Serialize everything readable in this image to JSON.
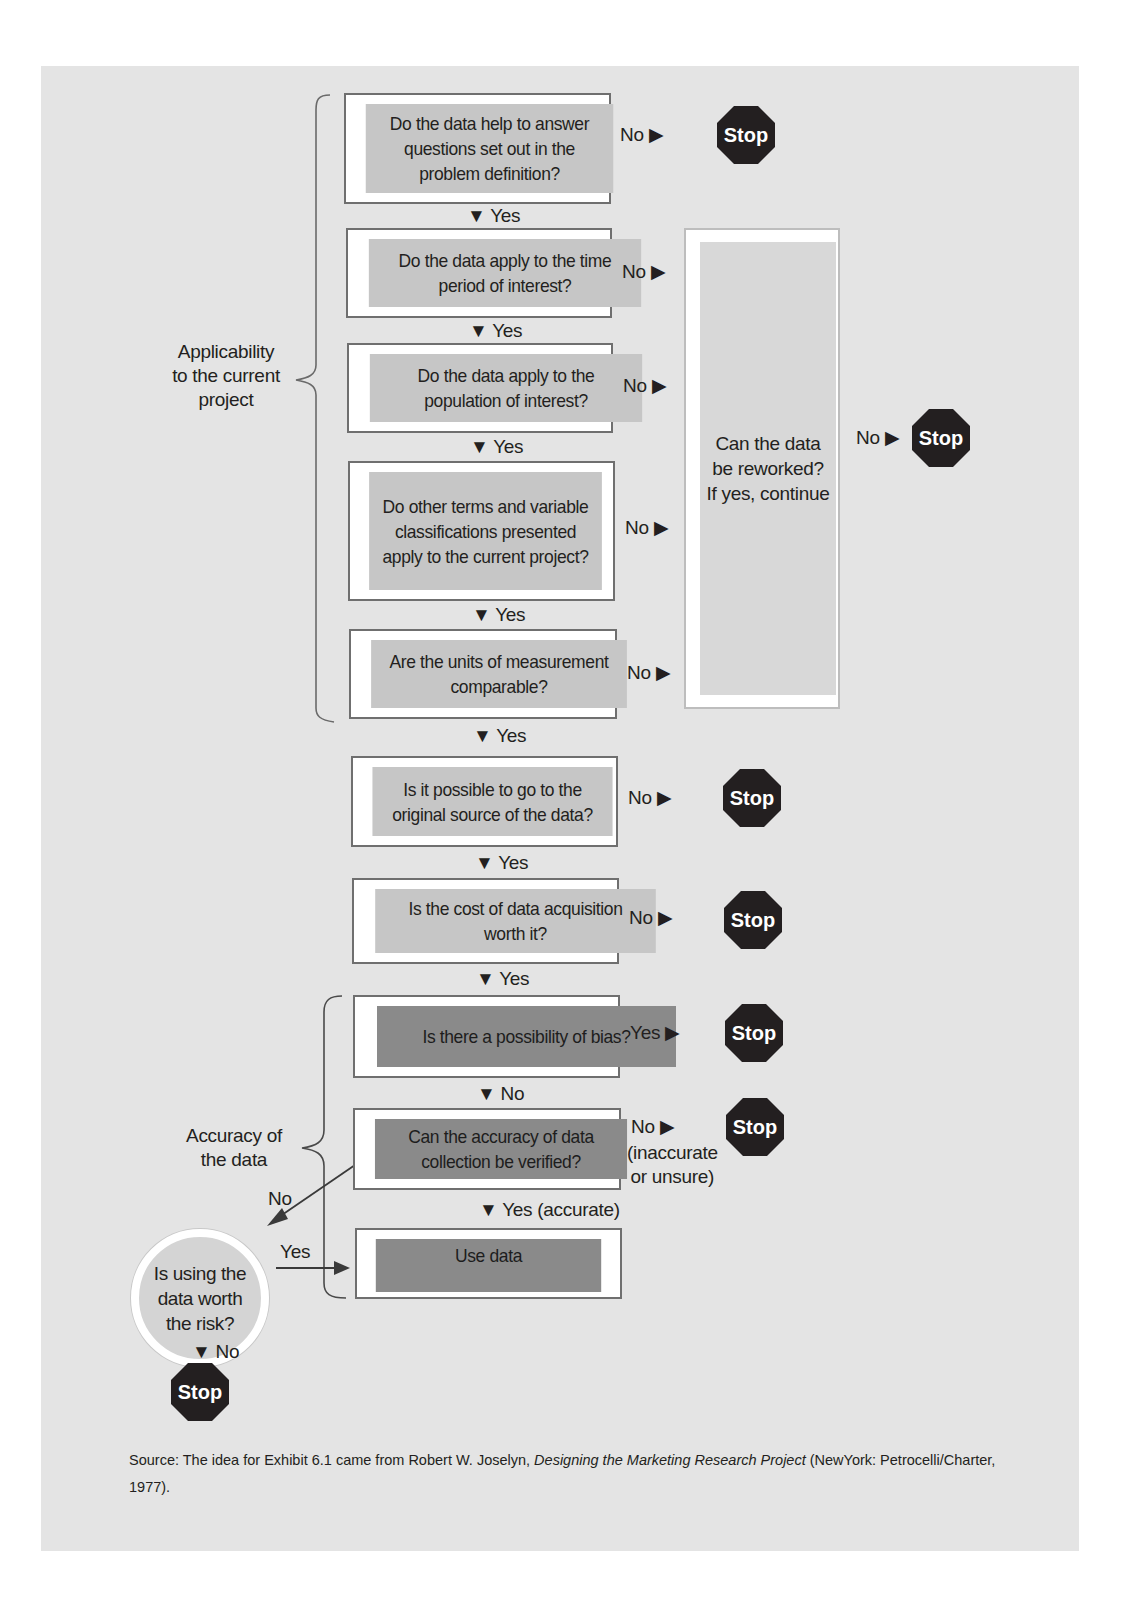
{
  "diagram": {
    "type": "flowchart",
    "groups": {
      "applicability": "Applicability\nto the current\nproject",
      "accuracy": "Accuracy of\nthe data"
    },
    "questions": [
      {
        "id": "q1",
        "text": "Do the data help to answer questions set out in the problem definition?",
        "no": "No ▶",
        "yes": "▼ Yes",
        "no_target": "Stop"
      },
      {
        "id": "q2",
        "text": "Do the data apply to the time period of interest?",
        "no": "No ▶",
        "yes": "▼ Yes",
        "no_target": "rework"
      },
      {
        "id": "q3",
        "text": "Do the data apply to the population of interest?",
        "no": "No ▶",
        "yes": "▼ Yes",
        "no_target": "rework"
      },
      {
        "id": "q4",
        "text": "Do other terms and variable classifications presented apply to the current project?",
        "no": "No ▶",
        "yes": "▼ Yes",
        "no_target": "rework"
      },
      {
        "id": "q5",
        "text": "Are the units of measurement comparable?",
        "no": "No ▶",
        "yes": "▼ Yes",
        "no_target": "rework"
      },
      {
        "id": "q6",
        "text": "Is it possible to go to the original source of the data?",
        "no": "No ▶",
        "yes": "▼ Yes",
        "no_target": "Stop"
      },
      {
        "id": "q7",
        "text": "Is the cost of data acquisition worth it?",
        "no": "No ▶",
        "yes": "▼ Yes",
        "no_target": "Stop"
      },
      {
        "id": "q8",
        "text": "Is there a possibility of bias?",
        "no": "Yes ▶",
        "yes": "▼ No",
        "no_target": "Stop"
      },
      {
        "id": "q9",
        "text": "Can the accuracy of data collection be verified?",
        "no": "No ▶",
        "no_note": "(inaccurate\nor unsure)",
        "yes": "▼ Yes (accurate)",
        "no_target": "Stop",
        "alt_branch": "No"
      },
      {
        "id": "use",
        "text": "Use data"
      }
    ],
    "rework": {
      "text": "Can the data be reworked? If yes, continue",
      "no": "No ▶",
      "no_target": "Stop"
    },
    "risk": {
      "text": "Is using the data worth the risk?",
      "yes": "Yes",
      "no": "▼ No",
      "no_target": "Stop",
      "incoming": "No"
    },
    "stop_label": "Stop",
    "source": {
      "prefix": "Source: The idea for Exhibit 6.1 came from Robert W. Joselyn, ",
      "title": "Designing the Marketing Research Project",
      "suffix": " (NewYork: Petrocelli/Charter, 1977)."
    },
    "colors": {
      "panel": "#e4e4e4",
      "box_light": "#c2c2c2",
      "box_dark": "#8a8a8a",
      "stop": "#231f20"
    }
  }
}
